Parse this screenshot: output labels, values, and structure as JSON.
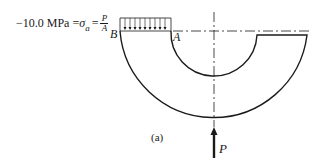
{
  "figure": {
    "equation": {
      "value": "−10.0 MPa",
      "equals": "=",
      "sigma": "σ",
      "sigma_sub": "a",
      "equals2": "=",
      "numerator": "P",
      "denominator": "A"
    },
    "point_labels": {
      "B": "B",
      "A": "A"
    },
    "load_label": "P",
    "caption": "(a)"
  },
  "colors": {
    "ink": "#1a1a1a",
    "background": "#ffffff"
  }
}
